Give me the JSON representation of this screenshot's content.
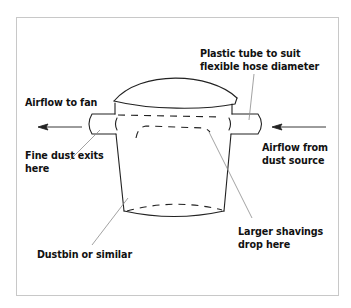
{
  "diagram": {
    "type": "cyclone-dust-separator",
    "labels": {
      "plastic_tube": "Plastic tube to suit\nflexible hose diameter",
      "airflow_to_fan": "Airflow to fan",
      "fine_dust": "Fine dust exits\nhere",
      "airflow_from": "Airflow from\ndust source",
      "larger_shavings": "Larger shavings\ndrop here",
      "dustbin": "Dustbin or similar"
    },
    "colors": {
      "stroke": "#222222",
      "leader": "#8a8a8a",
      "frame": "#c8c8c8",
      "text": "#111111"
    }
  }
}
